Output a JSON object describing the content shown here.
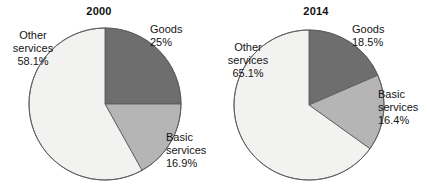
{
  "figure": {
    "background": "#ffffff",
    "panel_count": 2
  },
  "chart_data": [
    {
      "type": "pie",
      "title": "2000",
      "xlabel": "",
      "ylabel": "",
      "categories": [
        "Goods",
        "Basic services",
        "Other services"
      ],
      "values": [
        25.0,
        16.9,
        58.1
      ],
      "labels": [
        "25%",
        "16.9%",
        "16.9%"
      ],
      "value_labels": [
        "25%",
        "16.9%",
        "58.1%"
      ],
      "colors": [
        "#6e6e6e",
        "#b5b5b5",
        "#f2f2f0"
      ],
      "start_angle_deg": 0,
      "direction": "clockwise",
      "legend": "none",
      "grid": false,
      "slices": [
        {
          "name": "Goods",
          "value": 25.0,
          "value_label": "25%",
          "color": "#6e6e6e"
        },
        {
          "name": "Basic services",
          "value": 16.9,
          "value_label": "16.9%",
          "color": "#b5b5b5"
        },
        {
          "name": "Other services",
          "value": 58.1,
          "value_label": "58.1%",
          "color": "#f2f2f0"
        }
      ]
    },
    {
      "type": "pie",
      "title": "2014",
      "xlabel": "",
      "ylabel": "",
      "categories": [
        "Goods",
        "Basic services",
        "Other services"
      ],
      "values": [
        18.5,
        16.4,
        65.1
      ],
      "value_labels": [
        "18.5%",
        "16.4%",
        "65.1%"
      ],
      "colors": [
        "#6e6e6e",
        "#b5b5b5",
        "#f2f2f0"
      ],
      "start_angle_deg": 0,
      "direction": "clockwise",
      "legend": "none",
      "grid": false,
      "slices": [
        {
          "name": "Goods",
          "value": 18.5,
          "value_label": "18.5%",
          "color": "#6e6e6e"
        },
        {
          "name": "Basic services",
          "value": 16.4,
          "value_label": "16.4%",
          "color": "#b5b5b5"
        },
        {
          "name": "Other services",
          "value": 65.1,
          "value_label": "65.1%",
          "color": "#f2f2f0"
        }
      ]
    }
  ],
  "panels": [
    {
      "title": "2000",
      "labels": {
        "other": {
          "name_line1": "Other",
          "name_line2": "services",
          "value": "58.1%"
        },
        "goods": {
          "name": "Goods",
          "value": "25%"
        },
        "basic": {
          "name_line1": "Basic",
          "name_line2": "services",
          "value": "16.9%"
        }
      }
    },
    {
      "title": "2014",
      "labels": {
        "other": {
          "name_line1": "Other",
          "name_line2": "services",
          "value": "65.1%"
        },
        "goods": {
          "name": "Goods",
          "value": "18.5%"
        },
        "basic": {
          "name_line1": "Basic",
          "name_line2": "services",
          "value": "16.4%"
        }
      }
    }
  ]
}
